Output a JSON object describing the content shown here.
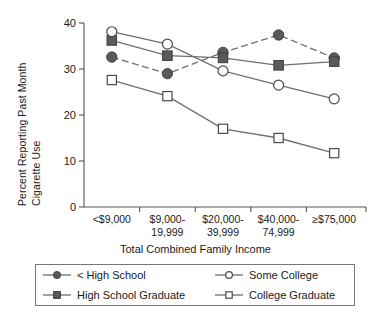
{
  "chart_data": {
    "type": "line",
    "title": "",
    "xlabel": "Total Combined Family Income",
    "ylabel": "Percent Reporting Past Month Cigarette Use",
    "ylabel_lines": [
      "Percent Reporting Past Month",
      "Cigarette Use"
    ],
    "categories": [
      "<$9,000",
      "$9,000-19,999",
      "$20,000-39,999",
      "$40,000-74,999",
      "≥$75,000"
    ],
    "category_lines": [
      [
        "<$9,000",
        ""
      ],
      [
        "$9,000-",
        "19,999"
      ],
      [
        "$20,000-",
        "39,999"
      ],
      [
        "$40,000-",
        "74,999"
      ],
      [
        "≥$75,000",
        ""
      ]
    ],
    "ylim": [
      0,
      40
    ],
    "yticks": [
      0,
      10,
      20,
      30,
      40
    ],
    "ytick_labels": [
      "0",
      "10",
      "20",
      "30",
      "40"
    ],
    "grid": false,
    "legend_position": "below-plot",
    "series": [
      {
        "name": "< High School",
        "marker": "filled-circle",
        "linestyle": "dashed",
        "color": "#5a5a5a",
        "values": [
          32.6,
          29.0,
          33.6,
          37.4,
          32.4
        ]
      },
      {
        "name": "High School Graduate",
        "marker": "filled-square",
        "linestyle": "solid",
        "color": "#5a5a5a",
        "values": [
          36.2,
          32.9,
          32.4,
          30.8,
          31.6
        ]
      },
      {
        "name": "Some College",
        "marker": "open-circle",
        "linestyle": "solid",
        "color": "#4a4a4a",
        "values": [
          38.1,
          35.4,
          29.6,
          26.5,
          23.5
        ]
      },
      {
        "name": "College Graduate",
        "marker": "open-square",
        "linestyle": "solid",
        "color": "#4a4a4a",
        "values": [
          27.6,
          24.1,
          17.0,
          15.0,
          11.7
        ]
      }
    ]
  },
  "legend": {
    "items": [
      {
        "label": "< High School",
        "marker": "filled-circle"
      },
      {
        "label": "Some College",
        "marker": "open-circle"
      },
      {
        "label": "High School Graduate",
        "marker": "filled-square"
      },
      {
        "label": "College Graduate",
        "marker": "open-square"
      }
    ]
  }
}
